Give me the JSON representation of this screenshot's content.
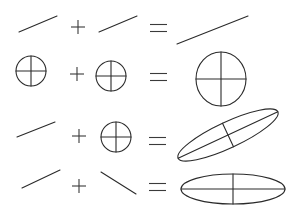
{
  "diagram": {
    "title": "",
    "stroke_color": "#2a2a2a",
    "background": "#ffffff",
    "rows": [
      {
        "id": "row-1",
        "terms": [
          {
            "shape": "line",
            "x1": 19,
            "y1": 32,
            "x2": 57,
            "y2": 16
          },
          {
            "op": "plus",
            "cx": 78,
            "cy": 27
          },
          {
            "shape": "line",
            "x1": 99,
            "y1": 32,
            "x2": 137,
            "y2": 16
          },
          {
            "op": "equals",
            "x1": 150,
            "x2": 167,
            "cy": 28
          },
          {
            "shape": "line",
            "x1": 177,
            "y1": 44,
            "x2": 248,
            "y2": 16
          }
        ]
      },
      {
        "id": "row-2",
        "terms": [
          {
            "shape": "circle-cross",
            "cx": 31,
            "cy": 71,
            "r": 15
          },
          {
            "op": "plus",
            "cx": 77,
            "cy": 74
          },
          {
            "shape": "circle-cross",
            "cx": 111,
            "cy": 76,
            "r": 15
          },
          {
            "op": "equals",
            "x1": 150,
            "x2": 167,
            "cy": 77
          },
          {
            "shape": "circle-cross",
            "cx": 221,
            "cy": 79,
            "rx": 25,
            "ry": 27
          }
        ]
      },
      {
        "id": "row-3",
        "terms": [
          {
            "shape": "line",
            "x1": 17,
            "y1": 137,
            "x2": 55,
            "y2": 122
          },
          {
            "op": "plus",
            "cx": 79,
            "cy": 136
          },
          {
            "shape": "circle-cross",
            "cx": 116,
            "cy": 137,
            "r": 15
          },
          {
            "op": "equals",
            "x1": 149,
            "x2": 166,
            "cy": 141
          },
          {
            "shape": "ellipse-cross",
            "cx": 228,
            "cy": 135,
            "rx": 55,
            "ry": 13,
            "angle": -25
          }
        ]
      },
      {
        "id": "row-4",
        "terms": [
          {
            "shape": "line",
            "x1": 22,
            "y1": 188,
            "x2": 60,
            "y2": 170
          },
          {
            "op": "plus",
            "cx": 79,
            "cy": 186
          },
          {
            "shape": "line",
            "x1": 101,
            "y1": 172,
            "x2": 136,
            "y2": 194
          },
          {
            "op": "equals",
            "x1": 149,
            "x2": 166,
            "cy": 187
          },
          {
            "shape": "ellipse-cross",
            "cx": 233,
            "cy": 189,
            "rx": 52,
            "ry": 15,
            "angle": 0
          }
        ]
      }
    ]
  }
}
